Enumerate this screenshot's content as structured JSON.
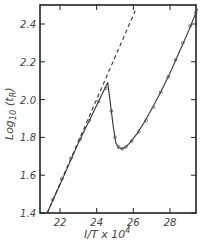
{
  "chart_data": {
    "type": "line",
    "title": "",
    "xlabel": "1/T x 10^4",
    "ylabel": "Log10 (tR)",
    "xlabel_text": "I/T x 10",
    "xlabel_sup": "4",
    "ylabel_text": "Log",
    "ylabel_sub": "10",
    "ylabel_paren": "(t",
    "ylabel_paren_sub": "R",
    "ylabel_close": ")",
    "xlim": [
      21.1,
      29.6
    ],
    "ylim": [
      1.4,
      2.5
    ],
    "x_ticks": [
      22,
      24,
      26,
      28
    ],
    "x_tick_labels": [
      "22",
      "24",
      "26",
      "28"
    ],
    "y_ticks": [
      1.4,
      1.6,
      1.8,
      2.0,
      2.2,
      2.4
    ],
    "y_tick_labels": [
      "1.4",
      "1.6",
      "1.8",
      "2.0",
      "2.2",
      "2.4"
    ],
    "grid": false,
    "legend": null,
    "series": [
      {
        "name": "fitted curve",
        "style": "solid",
        "x": [
          21.3,
          22.0,
          22.5,
          23.0,
          23.5,
          24.0,
          24.6,
          24.75,
          24.9,
          25.05,
          25.2,
          25.35,
          25.5,
          25.8,
          26.2,
          26.6,
          27.0,
          27.5,
          28.0,
          28.5,
          29.0,
          29.5
        ],
        "y": [
          1.4,
          1.55,
          1.66,
          1.77,
          1.87,
          1.97,
          2.09,
          1.98,
          1.86,
          1.77,
          1.745,
          1.74,
          1.745,
          1.77,
          1.82,
          1.88,
          1.95,
          2.04,
          2.14,
          2.25,
          2.36,
          2.48
        ]
      },
      {
        "name": "extrapolated line",
        "style": "dashed",
        "x": [
          21.3,
          26.1
        ],
        "y": [
          1.4,
          2.47
        ]
      },
      {
        "name": "experimental points",
        "style": "markers",
        "x": [
          21.6,
          22.1,
          22.6,
          23.1,
          23.6,
          24.1,
          24.5,
          24.8,
          25.0,
          25.2,
          25.4,
          25.6,
          25.9,
          26.3,
          26.7,
          27.1,
          27.5,
          27.9,
          28.3,
          28.7,
          29.1,
          29.4
        ],
        "y": [
          1.47,
          1.58,
          1.69,
          1.79,
          1.89,
          1.99,
          2.06,
          1.94,
          1.8,
          1.75,
          1.74,
          1.75,
          1.78,
          1.83,
          1.89,
          1.96,
          2.04,
          2.12,
          2.21,
          2.3,
          2.39,
          2.46
        ]
      }
    ]
  }
}
